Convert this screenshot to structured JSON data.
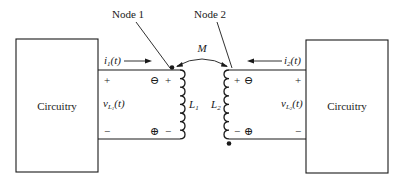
{
  "diagram": {
    "left_block": {
      "label": "Circuitry"
    },
    "right_block": {
      "label": "Circuitry"
    },
    "node_labels": {
      "node1": "Node 1",
      "node2": "Node 2"
    },
    "mutual_inductance": {
      "symbol": "M"
    },
    "inductors": {
      "L1": {
        "symbol": "L",
        "subscript": "1",
        "dot": "top"
      },
      "L2": {
        "symbol": "L",
        "subscript": "2",
        "dot": "bottom"
      }
    },
    "currents": {
      "i1": {
        "symbol": "i",
        "subscript": "1",
        "arg": "(t)",
        "direction": "right"
      },
      "i2": {
        "symbol": "i",
        "subscript": "2",
        "arg": "(t)",
        "direction": "left"
      }
    },
    "voltages": {
      "vL1": {
        "symbol": "v",
        "subscript": "L",
        "subsub": "1",
        "arg": "(t)"
      },
      "vL2": {
        "symbol": "v",
        "subscript": "L",
        "subsub": "2",
        "arg": "(t)"
      }
    },
    "polarity": {
      "left_outer_top": "+",
      "left_outer_bottom": "−",
      "L1_self_top": "+",
      "L1_self_bottom": "−",
      "L1_mutual_top": "⊖",
      "L1_mutual_bottom": "⊕",
      "L2_self_top": "+",
      "L2_self_bottom": "−",
      "L2_mutual_top": "⊖",
      "L2_mutual_bottom": "⊕",
      "right_outer_top": "+",
      "right_outer_bottom": "−"
    },
    "colors": {
      "line": "#1a1a1a",
      "background": "#ffffff"
    }
  }
}
